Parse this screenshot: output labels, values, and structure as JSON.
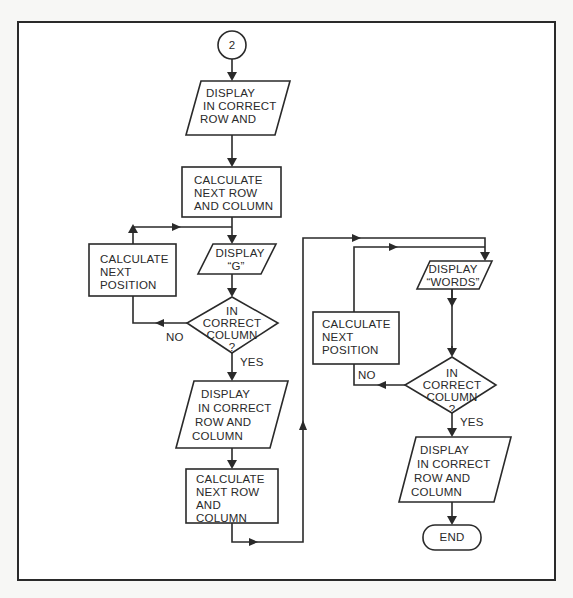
{
  "diagram": {
    "type": "flowchart",
    "connector": {
      "label": "2"
    },
    "left_column": {
      "display_1": {
        "lines": [
          "DISPLAY",
          "IN CORRECT",
          "ROW AND",
          "COLUMN"
        ]
      },
      "calc_1": {
        "lines": [
          "CALCULATE",
          "NEXT ROW",
          "AND COLUMN"
        ]
      },
      "display_g": {
        "lines": [
          "DISPLAY",
          "“G”"
        ]
      },
      "calc_pos": {
        "lines": [
          "CALCULATE",
          "NEXT",
          "POSITION"
        ]
      },
      "decision": {
        "lines": [
          "IN",
          "CORRECT",
          "COLUMN",
          "?"
        ]
      },
      "no_label": "NO",
      "yes_label": "YES",
      "display_2": {
        "lines": [
          "DISPLAY",
          "IN CORRECT",
          "ROW AND",
          "COLUMN"
        ]
      },
      "calc_2": {
        "lines": [
          "CALCULATE",
          "NEXT ROW",
          "AND",
          "COLUMN"
        ]
      }
    },
    "right_column": {
      "display_words": {
        "lines": [
          "DISPLAY",
          "“WORDS”"
        ]
      },
      "calc_pos": {
        "lines": [
          "CALCULATE",
          "NEXT",
          "POSITION"
        ]
      },
      "decision": {
        "lines": [
          "IN",
          "CORRECT",
          "COLUMN",
          "?"
        ]
      },
      "no_label": "NO",
      "yes_label": "YES",
      "display_3": {
        "lines": [
          "DISPLAY",
          "IN CORRECT",
          "ROW AND",
          "COLUMN"
        ]
      },
      "end": {
        "label": "END"
      }
    }
  }
}
